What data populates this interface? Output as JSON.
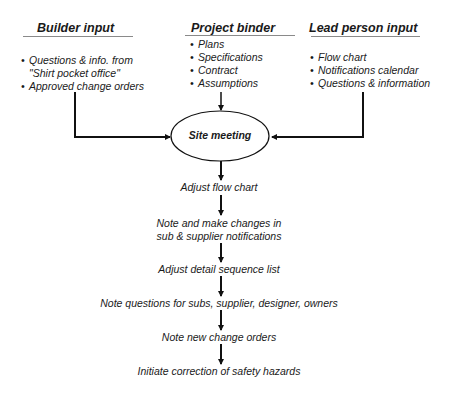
{
  "diagram": {
    "columns": [
      {
        "header": "Builder input",
        "items": [
          [
            "Questions & info. from",
            "\"Shirt pocket office\""
          ],
          [
            "Approved change orders"
          ]
        ]
      },
      {
        "header": "Project binder",
        "items": [
          [
            "Plans"
          ],
          [
            "Specifications"
          ],
          [
            "Contract"
          ],
          [
            "Assumptions"
          ]
        ]
      },
      {
        "header": "Lead person input",
        "items": [
          [
            "Flow chart"
          ],
          [
            "Notifications calendar"
          ],
          [
            "Questions & information"
          ]
        ]
      }
    ],
    "central_node": "Site meeting",
    "steps": [
      "Adjust flow chart",
      "Note and make changes in",
      "sub & supplier notifications",
      "Adjust detail sequence list",
      "Note questions for subs, supplier, designer, owners",
      "Note new change orders",
      "Initiate correction of safety hazards"
    ],
    "colors": {
      "line": "#111111",
      "rule": "#8a8a8a",
      "text": "#1a1a1a"
    }
  }
}
